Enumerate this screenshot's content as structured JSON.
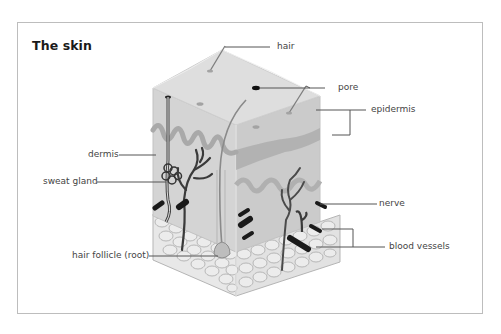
{
  "figure": {
    "title": "The skin",
    "labels": {
      "hair": "hair",
      "pore": "pore",
      "epidermis": "epidermis",
      "dermis": "dermis",
      "sweat_gland": "sweat gland",
      "nerve": "nerve",
      "blood_vessels": "blood vessels",
      "hair_follicle": "hair follicle (root)"
    },
    "colors": {
      "frame": "#bdbdbd",
      "skin_top": "#d9d9d9",
      "skin_side": "#cfcfcf",
      "dermis_wave": "#a8a8a8",
      "vessel": "#333333",
      "fat_cells": "#e6e6e6",
      "leader_line": "#555555"
    }
  }
}
